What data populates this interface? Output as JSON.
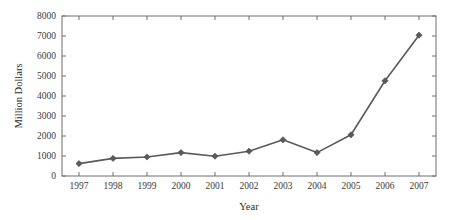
{
  "chart_data": {
    "type": "line",
    "title": "",
    "subtitle": "",
    "xlabel": "Year",
    "ylabel": "Million Dollars",
    "categories": [
      "1997",
      "1998",
      "1999",
      "2000",
      "2001",
      "2002",
      "2003",
      "2004",
      "2005",
      "2006",
      "2007"
    ],
    "x": [
      1997,
      1998,
      1999,
      2000,
      2001,
      2002,
      2003,
      2004,
      2005,
      2006,
      2007
    ],
    "values": [
      620,
      880,
      950,
      1170,
      990,
      1240,
      1810,
      1170,
      2060,
      4760,
      7040
    ],
    "series": [
      {
        "name": "Million Dollars",
        "values": [
          620,
          880,
          950,
          1170,
          990,
          1240,
          1810,
          1170,
          2060,
          4760,
          7040
        ]
      }
    ],
    "xlim": [
      1996.5,
      2007.5
    ],
    "ylim": [
      0,
      8000
    ],
    "ytick_values": [
      0,
      1000,
      2000,
      3000,
      4000,
      5000,
      6000,
      7000,
      8000
    ],
    "ytick_labels": [
      "0",
      "1000",
      "2000",
      "3000",
      "4000",
      "5000",
      "6000",
      "7000",
      "8000"
    ],
    "xtick_labels": [
      "1997",
      "1998",
      "1999",
      "2000",
      "2001",
      "2002",
      "2003",
      "2004",
      "2005",
      "2006",
      "2007"
    ],
    "grid": false,
    "legend": false,
    "legend_position": "none",
    "marker": "diamond",
    "line_color": "#5a5a5a",
    "marker_color": "#5a5a5a",
    "axis_color": "#6e6e6e",
    "background_color": "#ffffff",
    "annotations": []
  }
}
